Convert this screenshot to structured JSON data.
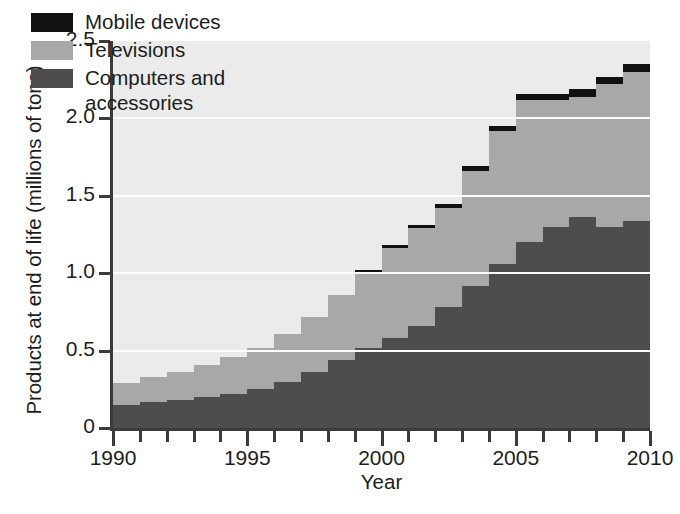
{
  "chart_data": {
    "type": "area",
    "subtype": "stacked-step",
    "title": "",
    "xlabel": "Year",
    "ylabel": "Products at end of life (millions of tons)",
    "xlim": [
      1990,
      2010
    ],
    "ylim": [
      0,
      2.5
    ],
    "grid": true,
    "grid_values": [
      0.5,
      1.0,
      1.5,
      2.0
    ],
    "legend_position": "top-left-inside",
    "x": [
      1990,
      1991,
      1992,
      1993,
      1994,
      1995,
      1996,
      1997,
      1998,
      1999,
      2000,
      2001,
      2002,
      2003,
      2004,
      2005,
      2006,
      2007,
      2008,
      2009,
      2010
    ],
    "xticks_major": [
      1990,
      1995,
      2000,
      2005,
      2010
    ],
    "xtick_labels": [
      "1990",
      "1995",
      "2000",
      "2005",
      "2010"
    ],
    "yticks": [
      0,
      0.5,
      1.0,
      1.5,
      2.0,
      2.5
    ],
    "ytick_labels": [
      "0",
      "0.5",
      "1.0",
      "1.5",
      "2.0",
      "2.5"
    ],
    "series": [
      {
        "name": "Computers and accessories",
        "color": "#4d4d4d",
        "values": [
          0.15,
          0.17,
          0.18,
          0.2,
          0.22,
          0.25,
          0.3,
          0.36,
          0.44,
          0.52,
          0.58,
          0.66,
          0.78,
          0.92,
          1.06,
          1.2,
          1.3,
          1.36,
          1.3,
          1.34,
          1.38
        ]
      },
      {
        "name": "Televisions",
        "color": "#a8a8a8",
        "values": [
          0.14,
          0.16,
          0.18,
          0.21,
          0.24,
          0.27,
          0.31,
          0.36,
          0.42,
          0.49,
          0.58,
          0.63,
          0.64,
          0.74,
          0.86,
          0.92,
          0.82,
          0.78,
          0.92,
          0.96,
          1.0
        ]
      },
      {
        "name": "Mobile devices",
        "color": "#111111",
        "values": [
          0.0,
          0.0,
          0.0,
          0.0,
          0.0,
          0.0,
          0.0,
          0.0,
          0.0,
          0.01,
          0.02,
          0.02,
          0.03,
          0.03,
          0.03,
          0.04,
          0.04,
          0.05,
          0.05,
          0.05,
          0.06
        ]
      }
    ],
    "totals": [
      0.29,
      0.33,
      0.36,
      0.41,
      0.46,
      0.52,
      0.61,
      0.72,
      0.86,
      1.02,
      1.18,
      1.31,
      1.45,
      1.69,
      1.95,
      2.16,
      2.16,
      2.19,
      2.27,
      2.35,
      2.44
    ]
  },
  "legend": {
    "items": [
      {
        "label": "Mobile devices",
        "color": "#111111"
      },
      {
        "label": "Televisions",
        "color": "#a8a8a8"
      },
      {
        "label": "Computers and\naccessories",
        "color": "#4d4d4d"
      }
    ]
  },
  "axes": {
    "y_title": "Products at end of life (millions of tons)",
    "x_title": "Year"
  },
  "colors": {
    "plot_background": "#ebebeb",
    "gridline": "#fdfdfd",
    "axis": "#3b3b3b",
    "text": "#1d1d1d"
  }
}
